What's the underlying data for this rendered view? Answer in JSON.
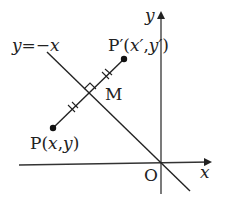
{
  "diagram": {
    "line_label": "y = −x",
    "line_label_parts": {
      "y": "y",
      "eq": "=",
      "rhs": "−x"
    },
    "point_p": {
      "name": "P",
      "coords": "(x, y)",
      "open": "(",
      "x": "x",
      "comma": ",",
      "y": "y",
      "close": ")"
    },
    "point_p_prime": {
      "name": "P′",
      "open": "(",
      "x": "x′",
      "comma": ",",
      "y": "y′",
      "close": ")"
    },
    "midpoint": "M",
    "origin": "O",
    "x_axis": "x",
    "y_axis": "y",
    "colors": {
      "stroke": "#222222",
      "background": "#ffffff"
    }
  }
}
